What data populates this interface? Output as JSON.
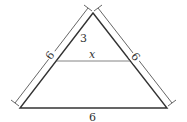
{
  "diagram": {
    "type": "triangle-with-parallel-segment",
    "labels": {
      "top_segment": "3",
      "parallel_segment": "x",
      "left_side": "6",
      "right_side": "6",
      "base": "6"
    },
    "colors": {
      "stroke": "#333333",
      "thin_stroke": "#555555",
      "background": "#ffffff"
    }
  }
}
